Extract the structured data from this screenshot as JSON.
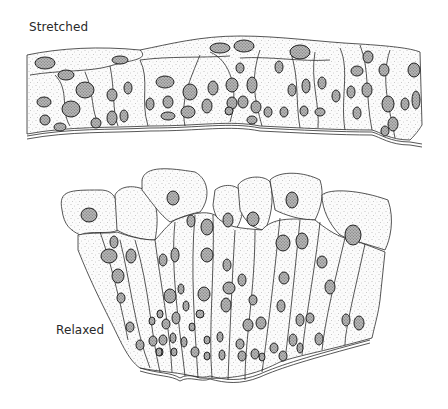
{
  "figure": {
    "panels": [
      {
        "id": "stretched",
        "label": "Stretched"
      },
      {
        "id": "relaxed",
        "label": "Relaxed"
      }
    ]
  },
  "colors": {
    "ink": "#2b2b2b",
    "background": "#ffffff",
    "stipple": "#8a8a8a"
  }
}
